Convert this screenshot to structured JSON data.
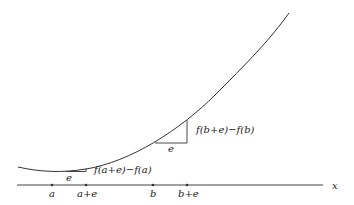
{
  "diagram": {
    "axis_label": "x",
    "tick_labels": [
      "a",
      "a+e",
      "b",
      "b+e"
    ],
    "increment_label": "e",
    "increment_a_label": "f(a+e)−f(a)",
    "increment_b_label": "f(b+e)−f(b)",
    "colors": {
      "line": "#333333",
      "background": "#ffffff"
    }
  }
}
